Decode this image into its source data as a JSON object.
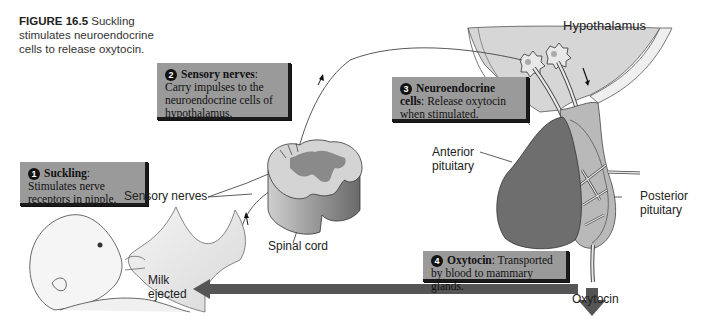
{
  "caption": {
    "figure_label": "FIGURE 16.5",
    "text": "Suckling stimulates neuroendocrine cells to release oxytocin."
  },
  "steps": [
    {
      "number": "1",
      "heading": "Suckling",
      "body": "Stimulates nerve receptors in nipple."
    },
    {
      "number": "2",
      "heading": "Sensory nerves",
      "body": "Carry impulses to the neuroendocrine cells of hypothalamus."
    },
    {
      "number": "3",
      "heading": "Neuroendocrine cells",
      "body": "Release oxytocin when stimulated."
    },
    {
      "number": "4",
      "heading": "Oxytocin",
      "body": "Transported by blood to mammary glands."
    }
  ],
  "labels": {
    "hypothalamus": "Hypothalamus",
    "sensory_nerves": "Sensory nerves",
    "spinal_cord": "Spinal cord",
    "anterior_pituitary_1": "Anterior",
    "anterior_pituitary_2": "pituitary",
    "posterior_pituitary_1": "Posterior",
    "posterior_pituitary_2": "pituitary",
    "milk_ejected_1": "Milk",
    "milk_ejected_2": "ejected",
    "oxytocin": "Oxytocin"
  },
  "colors": {
    "box_fill": "#9a9a9a",
    "box_shadow": "#1a1a1a",
    "arrow": "#555555",
    "hypothalamus_fill": "#d6d6d6",
    "anterior_pituitary": "#6e6e6e",
    "spinal_gray_matter": "#8a8a8a"
  }
}
